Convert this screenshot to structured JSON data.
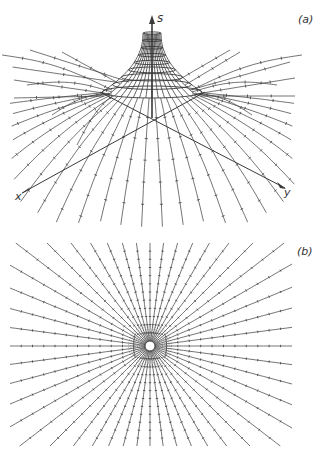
{
  "figure": {
    "panels": [
      {
        "id": "a",
        "label": "(a)",
        "axes": {
          "s": "s",
          "x": "x",
          "y": "y"
        },
        "description": "Funnel-shaped bundle of trajectories converging toward the s-axis, with lines fanning out to the x-y plane"
      },
      {
        "id": "b",
        "label": "(b)",
        "description": "Radial star of trajectories converging on a central point, projected view",
        "ray_count": 48
      }
    ],
    "colors": {
      "line": "#3a3a3a",
      "background": "#ffffff"
    }
  }
}
